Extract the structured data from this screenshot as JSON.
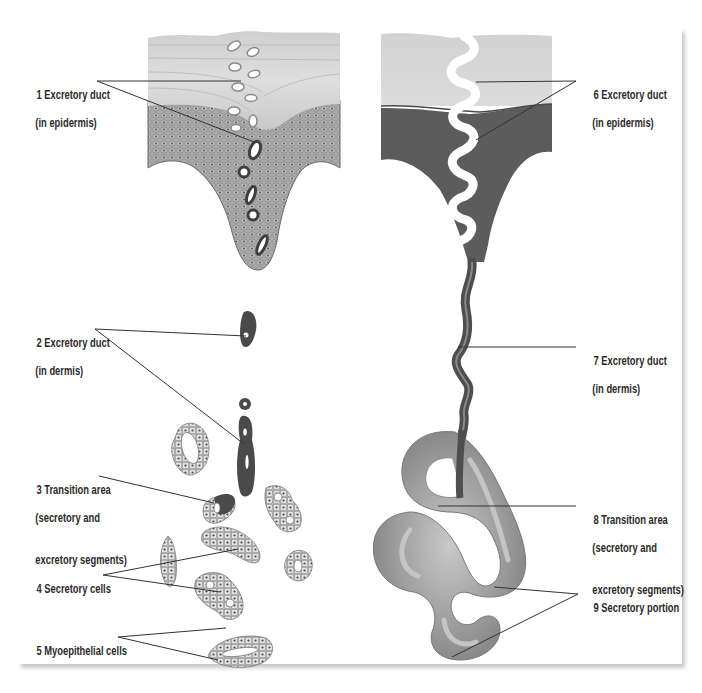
{
  "figure": {
    "left_panel": {
      "labels": [
        {
          "num": "1",
          "line1": "Excretory duct",
          "line2": "(in epidermis)"
        },
        {
          "num": "2",
          "line1": "Excretory duct",
          "line2": "(in dermis)"
        },
        {
          "num": "3",
          "line1": "Transition area",
          "line2": "(secretory and",
          "line3": "excretory segments)"
        },
        {
          "num": "4",
          "line1": "Secretory cells"
        },
        {
          "num": "5",
          "line1": "Myoepithelial cells"
        }
      ]
    },
    "right_panel": {
      "labels": [
        {
          "num": "6",
          "line1": "Excretory duct",
          "line2": "(in epidermis)"
        },
        {
          "num": "7",
          "line1": "Excretory duct",
          "line2": "(in dermis)"
        },
        {
          "num": "8",
          "line1": "Transition area",
          "line2": "(secretory and",
          "line3": "excretory segments)"
        },
        {
          "num": "9",
          "line1": "Secretory portion"
        }
      ]
    },
    "colors": {
      "stratum_corneum": "#d9d9d9",
      "epidermis_dark": "#5e5e5e",
      "duct_dark": "#4a4a4a",
      "coil": "#9a9a9a",
      "leader_line": "#333333",
      "label_text": "#2a2a2a"
    }
  }
}
